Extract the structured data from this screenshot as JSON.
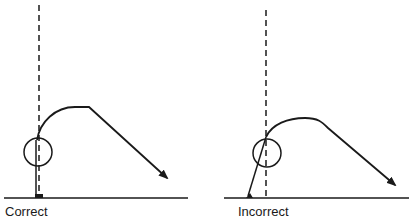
{
  "diagram": {
    "panels": [
      {
        "id": "correct",
        "label": "Correct"
      },
      {
        "id": "incorrect",
        "label": "Incorrect"
      }
    ],
    "colors": {
      "stroke": "#1a1a1a",
      "background": "#ffffff"
    }
  }
}
